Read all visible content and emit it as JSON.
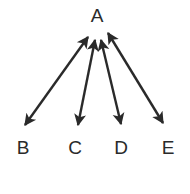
{
  "diagram": {
    "type": "arrow-fan",
    "colors": {
      "stroke": "#2a2a2a",
      "background": "#ffffff"
    },
    "nodes": [
      {
        "id": "A",
        "label": "A"
      },
      {
        "id": "B",
        "label": "B"
      },
      {
        "id": "C",
        "label": "C"
      },
      {
        "id": "D",
        "label": "D"
      },
      {
        "id": "E",
        "label": "E"
      }
    ],
    "edges": [
      {
        "from": "A",
        "to": "B",
        "direction": "bidirectional"
      },
      {
        "from": "A",
        "to": "C",
        "direction": "bidirectional"
      },
      {
        "from": "A",
        "to": "D",
        "direction": "bidirectional"
      },
      {
        "from": "A",
        "to": "E",
        "direction": "bidirectional"
      }
    ]
  }
}
